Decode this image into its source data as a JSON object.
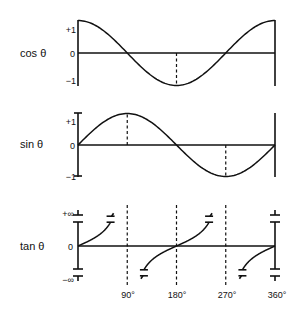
{
  "chart_data": [
    {
      "type": "line",
      "title": "cos θ",
      "function": "cos",
      "xlim": [
        0,
        360
      ],
      "ylim": [
        -1,
        1
      ],
      "y_tick_labels": [
        "+1",
        "0",
        "−1"
      ],
      "markers": [
        180
      ],
      "x": [
        0,
        45,
        90,
        135,
        180,
        225,
        270,
        315,
        360
      ],
      "values": [
        1,
        0.707,
        0,
        -0.707,
        -1,
        -0.707,
        0,
        0.707,
        1
      ]
    },
    {
      "type": "line",
      "title": "sin θ",
      "function": "sin",
      "xlim": [
        0,
        360
      ],
      "ylim": [
        -1,
        1
      ],
      "y_tick_labels": [
        "+1",
        "0",
        "−1"
      ],
      "markers": [
        90,
        270
      ],
      "x": [
        0,
        45,
        90,
        135,
        180,
        225,
        270,
        315,
        360
      ],
      "values": [
        0,
        0.707,
        1,
        0.707,
        0,
        -0.707,
        -1,
        -0.707,
        0
      ]
    },
    {
      "type": "line",
      "title": "tan θ",
      "function": "tan",
      "xlim": [
        0,
        360
      ],
      "ylim": [
        "-∞",
        "+∞"
      ],
      "y_tick_labels": [
        "+∞",
        "0",
        "−∞"
      ],
      "markers": [
        90,
        180,
        270
      ],
      "x_tick_labels": [
        "90°",
        "180°",
        "270°",
        "360°"
      ],
      "x_ticks": [
        90,
        180,
        270,
        360
      ]
    }
  ],
  "labels": {
    "cos": "cos θ",
    "sin": "sin θ",
    "tan": "tan θ"
  }
}
